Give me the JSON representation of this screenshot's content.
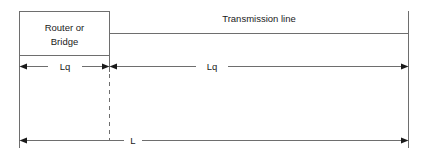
{
  "diagram": {
    "device_box": {
      "label_line1": "Router or",
      "label_line2": "Bridge"
    },
    "line_label": "Transmission line",
    "dimensions": [
      {
        "name": "lq-left",
        "label": "Lq"
      },
      {
        "name": "lq-right",
        "label": "Lq"
      },
      {
        "name": "total",
        "label": "L"
      }
    ],
    "colors": {
      "stroke": "#6e6e6e",
      "arrow": "#1a1a1a",
      "text": "#1a1a1a",
      "background": "#ffffff"
    }
  }
}
